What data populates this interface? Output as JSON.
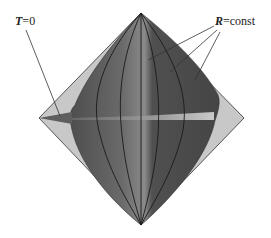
{
  "diagram": {
    "type": "penrose-like conformal diagram",
    "labels": {
      "t_zero": {
        "variable": "T",
        "equals": "=",
        "value": "0"
      },
      "r_const": {
        "variable": "R",
        "equals": "=",
        "value": "const"
      }
    },
    "vertices": {
      "top": [
        141,
        13
      ],
      "bottom": [
        141,
        225
      ],
      "left": [
        39,
        118
      ],
      "right": [
        244,
        118
      ]
    },
    "colors": {
      "outer_diamond": "#c8c8c8",
      "outer_edge": "#555555",
      "inner_region": "#5a5a5a",
      "inner_lighter": "#7a7a7a",
      "curves": "#1a1a1a",
      "t_zero_slice": "#d0d0d0",
      "leader_lines": "#333333"
    },
    "r_const_curve_count": 3
  }
}
